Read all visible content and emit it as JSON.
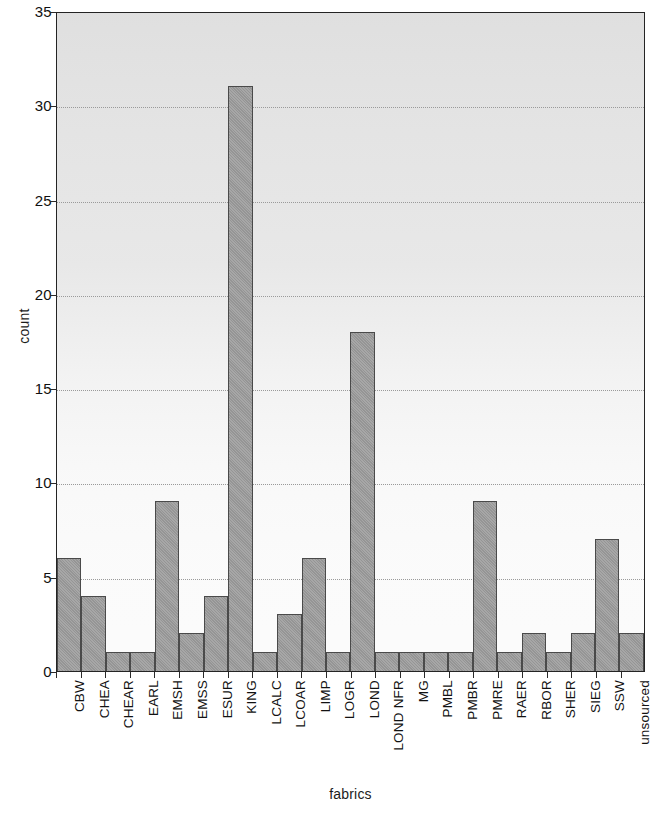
{
  "chart_data": {
    "type": "bar",
    "title": "",
    "xlabel": "fabrics",
    "ylabel": "count",
    "ylim": [
      0,
      35
    ],
    "yticks": [
      0,
      5,
      10,
      15,
      20,
      25,
      30,
      35
    ],
    "grid": true,
    "grid_axis": "y",
    "legend": "none",
    "bar_style": "adjacent-histogram",
    "categories": [
      "CBW",
      "CHEA",
      "CHEAR",
      "EARL",
      "EMSH",
      "EMSS",
      "ESUR",
      "KING",
      "LCALC",
      "LCOAR",
      "LIMP",
      "LOGR",
      "LOND",
      "LOND NFR",
      "MG",
      "PMBL",
      "PMBR",
      "PMRE",
      "RAER",
      "RBOR",
      "SHER",
      "SIEG",
      "SSW",
      "unsourced"
    ],
    "values": [
      6,
      4,
      1,
      1,
      9,
      2,
      4,
      31,
      1,
      3,
      6,
      1,
      18,
      1,
      1,
      1,
      1,
      9,
      1,
      2,
      1,
      2,
      7,
      2
    ],
    "colors": {
      "bar_fill": "#9d9d9d",
      "bar_edge": "#4a4a4a",
      "axis": "#242424",
      "grid": "#9a9a9a",
      "plot_background": "#fbfbfb",
      "text": "#121212"
    }
  }
}
